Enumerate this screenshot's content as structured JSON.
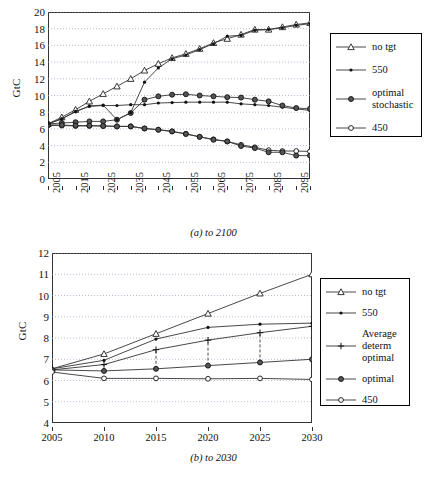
{
  "figures": [
    {
      "id": "a",
      "caption": "(a) to 2100",
      "ylabel": "GtC",
      "legend": [
        {
          "label": "no tgt",
          "marker": "triangle-open"
        },
        {
          "label": "550",
          "marker": "dot-small"
        },
        {
          "label": "optimal stochastic",
          "marker": "dot-large"
        },
        {
          "label": "450",
          "marker": "circle-open"
        }
      ]
    },
    {
      "id": "b",
      "caption": "(b) to 2030",
      "ylabel": "GtC",
      "legend": [
        {
          "label": "no tgt",
          "marker": "triangle-open"
        },
        {
          "label": "550",
          "marker": "dot-small"
        },
        {
          "label": "Average determ optimal",
          "marker": "plus"
        },
        {
          "label": "optimal",
          "marker": "dot-large"
        },
        {
          "label": "450",
          "marker": "circle-open"
        }
      ]
    }
  ],
  "chart_data": [
    {
      "type": "line",
      "id": "a",
      "title": "",
      "caption": "(a) to 2100",
      "xlabel": "",
      "ylabel": "GtC",
      "xlim": [
        2005,
        2100
      ],
      "ylim": [
        0,
        20
      ],
      "yticks": [
        0,
        2,
        4,
        6,
        8,
        10,
        12,
        14,
        16,
        18,
        20
      ],
      "xticks": [
        2005,
        2010,
        2015,
        2020,
        2025,
        2030,
        2035,
        2040,
        2045,
        2050,
        2055,
        2060,
        2065,
        2070,
        2075,
        2080,
        2085,
        2090,
        2095,
        2100
      ],
      "xtick_labels_shown": [
        2005,
        2015,
        2025,
        2035,
        2045,
        2055,
        2065,
        2075,
        2085,
        2095
      ],
      "grid": "horizontal-dotted",
      "legend_position": "right",
      "x": [
        2005,
        2010,
        2015,
        2020,
        2025,
        2030,
        2035,
        2040,
        2045,
        2050,
        2055,
        2060,
        2065,
        2070,
        2075,
        2080,
        2085,
        2090,
        2095,
        2100
      ],
      "series": [
        {
          "name": "no tgt",
          "marker": "triangle-open",
          "values": [
            6.6,
            7.4,
            8.3,
            9.3,
            10.2,
            11.1,
            12.0,
            13.0,
            13.8,
            14.5,
            15.0,
            15.6,
            16.3,
            16.8,
            17.3,
            17.9,
            17.9,
            18.2,
            18.5,
            18.7
          ]
        },
        {
          "name": "550",
          "marker": "dot-small",
          "values": [
            6.6,
            7.2,
            8.1,
            8.7,
            8.8,
            8.8,
            8.9,
            8.9,
            9.1,
            9.15,
            9.2,
            9.2,
            9.2,
            9.2,
            9.0,
            8.9,
            8.8,
            8.6,
            8.4,
            8.2
          ]
        },
        {
          "name": "optimal stochastic",
          "marker": "dot-large",
          "values": [
            6.6,
            6.7,
            6.8,
            6.9,
            6.9,
            7.1,
            7.9,
            9.5,
            9.9,
            10.1,
            10.15,
            10.0,
            9.9,
            9.8,
            9.75,
            9.5,
            9.3,
            8.8,
            8.5,
            8.4
          ]
        },
        {
          "name": "450",
          "marker": "circle-open",
          "values": [
            6.4,
            6.4,
            6.35,
            6.35,
            6.35,
            6.3,
            6.3,
            6.05,
            5.9,
            5.7,
            5.4,
            5.05,
            4.75,
            4.5,
            4.1,
            3.8,
            3.45,
            3.35,
            3.35,
            3.3
          ]
        },
        {
          "name": "optimal stochastic low branch",
          "marker": "dot-large",
          "values": [
            6.5,
            6.45,
            6.4,
            6.4,
            6.35,
            6.3,
            6.3,
            6.05,
            5.9,
            5.7,
            5.4,
            5.05,
            4.7,
            4.5,
            3.95,
            3.7,
            3.2,
            3.2,
            2.8,
            2.8
          ]
        },
        {
          "name": "550 upper branch",
          "marker": "dot-small",
          "values": [
            6.6,
            7.2,
            8.05,
            8.75,
            8.85,
            7.1,
            7.95,
            11.6,
            13.3,
            14.4,
            14.85,
            15.5,
            16.2,
            17.1,
            17.2,
            17.8,
            17.9,
            18.1,
            18.4,
            18.6
          ]
        }
      ],
      "notes": "Scenarios branch after 2035: one pathway follows the no-target trajectory upward, the other remains on the low mitigation pathway."
    },
    {
      "type": "line",
      "id": "b",
      "title": "",
      "caption": "(b) to 2030",
      "xlabel": "",
      "ylabel": "GtC",
      "xlim": [
        2005,
        2030
      ],
      "ylim": [
        4,
        12
      ],
      "yticks": [
        4,
        5,
        6,
        7,
        8,
        9,
        10,
        11,
        12
      ],
      "xticks": [
        2005,
        2010,
        2015,
        2020,
        2025,
        2030
      ],
      "grid": "horizontal-dotted",
      "legend_position": "right",
      "x": [
        2005,
        2010,
        2015,
        2020,
        2025,
        2030
      ],
      "series": [
        {
          "name": "no tgt",
          "marker": "triangle-open",
          "values": [
            6.55,
            7.25,
            8.2,
            9.15,
            10.1,
            11.0
          ]
        },
        {
          "name": "550",
          "marker": "dot-small",
          "values": [
            6.55,
            6.95,
            7.95,
            8.5,
            8.65,
            8.7
          ]
        },
        {
          "name": "Average determ optimal",
          "marker": "plus",
          "values": [
            6.5,
            6.75,
            7.45,
            7.9,
            8.25,
            8.55
          ]
        },
        {
          "name": "optimal",
          "marker": "dot-large",
          "values": [
            6.5,
            6.45,
            6.55,
            6.7,
            6.85,
            7.0
          ]
        },
        {
          "name": "450",
          "marker": "circle-open",
          "values": [
            6.4,
            6.1,
            6.1,
            6.08,
            6.1,
            6.05
          ]
        }
      ],
      "connectors": [
        {
          "x": 2010,
          "from": 6.45,
          "to": 6.75,
          "style": "dashed"
        },
        {
          "x": 2015,
          "from": 6.55,
          "to": 7.45,
          "style": "dashed"
        },
        {
          "x": 2020,
          "from": 6.7,
          "to": 7.9,
          "style": "dashed"
        },
        {
          "x": 2025,
          "from": 6.85,
          "to": 8.25,
          "style": "dashed"
        },
        {
          "x": 2030,
          "from": 7.0,
          "to": 8.7,
          "style": "dashed"
        }
      ]
    }
  ]
}
